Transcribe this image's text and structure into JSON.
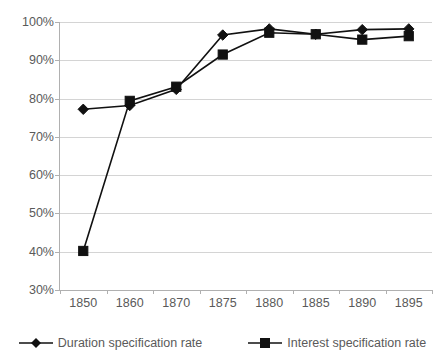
{
  "chart_data": {
    "type": "line",
    "title": "",
    "subtitle": "",
    "xlabel": "",
    "ylabel": "",
    "categories": [
      "1850",
      "1860",
      "1870",
      "1875",
      "1880",
      "1885",
      "1890",
      "1895"
    ],
    "ylim": [
      30,
      100
    ],
    "ytick_labels": [
      "30%",
      "40%",
      "50%",
      "60%",
      "70%",
      "80%",
      "90%",
      "100%"
    ],
    "ytick_values": [
      30,
      40,
      50,
      60,
      70,
      80,
      90,
      100
    ],
    "grid": "horizontal",
    "legend_position": "bottom",
    "series": [
      {
        "name": "Duration specification rate",
        "marker": "diamond",
        "color": "#111111",
        "values": [
          77.2,
          78.2,
          82.4,
          96.6,
          98.2,
          96.8,
          98.0,
          98.2
        ]
      },
      {
        "name": "Interest specification rate",
        "marker": "square",
        "color": "#111111",
        "values": [
          40.2,
          79.4,
          83.1,
          91.5,
          97.2,
          96.8,
          95.4,
          96.3
        ]
      }
    ]
  },
  "axis": {
    "y_unit": "%",
    "x_type": "category"
  },
  "legend": {
    "items": [
      {
        "label": "Duration specification rate",
        "marker": "diamond"
      },
      {
        "label": "Interest specification rate",
        "marker": "square"
      }
    ]
  },
  "colors": {
    "series": "#111111",
    "gridline": "#d4d4d4",
    "axis": "#b0b0b0",
    "text": "#5a5a5a",
    "background": "#ffffff"
  }
}
